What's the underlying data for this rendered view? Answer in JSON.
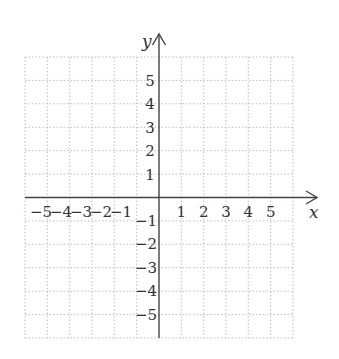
{
  "diagram": {
    "type": "coordinate-plane",
    "x_axis": {
      "label": "x",
      "min": -6,
      "max": 6,
      "tick_labels": [
        "-5",
        "-4",
        "-3",
        "-2",
        "-1",
        "1",
        "2",
        "3",
        "4",
        "5"
      ]
    },
    "y_axis": {
      "label": "y",
      "min": -6,
      "max": 6,
      "tick_labels": [
        "5",
        "4",
        "3",
        "2",
        "1",
        "-1",
        "-2",
        "-3",
        "-4",
        "-5"
      ]
    },
    "grid": {
      "style": "dotted",
      "color": "#bbbbbb",
      "step": 1
    },
    "axis_color": "#444444"
  },
  "labels": {
    "x_axis": "x",
    "y_axis": "y",
    "xpos": [
      "1",
      "2",
      "3",
      "4",
      "5"
    ],
    "xneg": [
      "−5",
      "−4",
      "−3",
      "−2",
      "−1"
    ],
    "ypos": [
      "5",
      "4",
      "3",
      "2",
      "1"
    ],
    "yneg": [
      "−1",
      "−2",
      "−3",
      "−4",
      "−5"
    ]
  }
}
